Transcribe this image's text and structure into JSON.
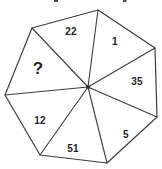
{
  "figure": {
    "type": "heptagon-number-puzzle",
    "background_color": "#ffffff",
    "line_color": "#3e3e3e",
    "text_color": "#262626",
    "sectors": [
      {
        "position": "top",
        "label": "22"
      },
      {
        "position": "top-right",
        "label": "1"
      },
      {
        "position": "right",
        "label": "35"
      },
      {
        "position": "bottom-right",
        "label": "5"
      },
      {
        "position": "bottom",
        "label": "51"
      },
      {
        "position": "bottom-left",
        "label": "12"
      },
      {
        "position": "left",
        "label": "?"
      }
    ]
  }
}
